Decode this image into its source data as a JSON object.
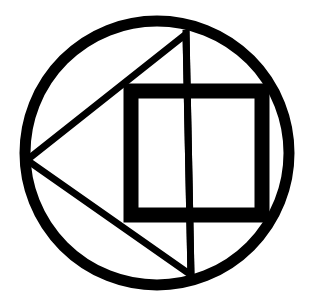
{
  "image": {
    "width": 312,
    "height": 308,
    "background": "#ffffff",
    "ink_color": "#000000",
    "description": "Black geometric symbol: circle enclosing a left-pointing triangle, a thick square, and a vertical line"
  },
  "symbol": {
    "circle": {
      "cx": 157,
      "cy": 153,
      "r": 132,
      "stroke_width": 11
    },
    "triangle": {
      "points": [
        [
          27,
          160
        ],
        [
          186,
          34
        ],
        [
          191,
          275
        ]
      ],
      "stroke_width": 7
    },
    "vertical_line": {
      "x1": 186,
      "y1": 30,
      "x2": 191,
      "y2": 278,
      "stroke_width": 7
    },
    "square": {
      "x": 131,
      "y": 91,
      "width": 131,
      "height": 124,
      "stroke_width": 15
    }
  }
}
